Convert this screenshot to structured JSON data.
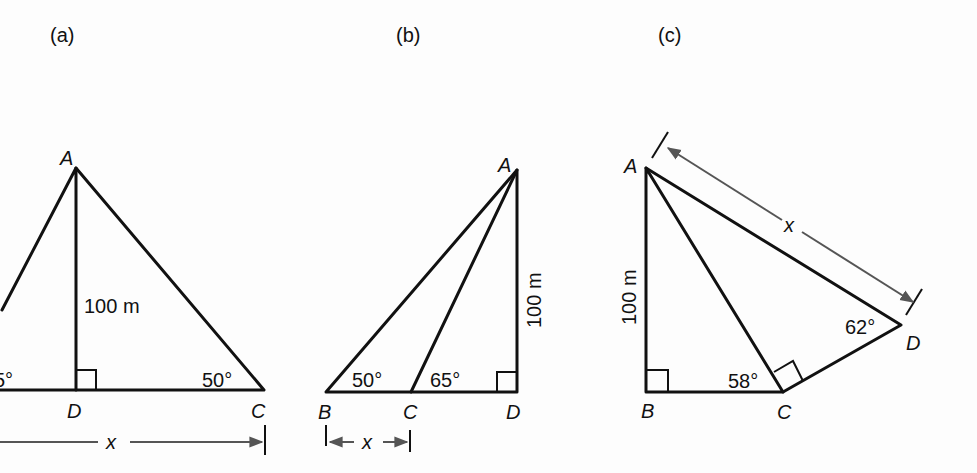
{
  "figures": [
    {
      "caption": "(a)",
      "vertices": {
        "A": "A",
        "D": "D",
        "C": "C"
      },
      "height_label": "100 m",
      "angles": {
        "left_partial": "5°",
        "C": "50°"
      },
      "dimension_label": "x"
    },
    {
      "caption": "(b)",
      "vertices": {
        "A": "A",
        "B": "B",
        "C": "C",
        "D": "D"
      },
      "height_label": "100 m",
      "angles": {
        "B": "50°",
        "C": "65°"
      },
      "dimension_label": "x"
    },
    {
      "caption": "(c)",
      "vertices": {
        "A": "A",
        "B": "B",
        "C": "C",
        "D": "D"
      },
      "height_label": "100 m",
      "angles": {
        "C": "58°",
        "D": "62°"
      },
      "dimension_label": "x"
    }
  ]
}
